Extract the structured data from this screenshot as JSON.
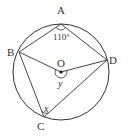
{
  "diagram": {
    "type": "inscribed-quadrilateral-circle",
    "colors": {
      "stroke": "#333333",
      "background": "#ffffff"
    },
    "circle": {
      "center_label": "O",
      "cx": 61,
      "cy": 72,
      "r": 48
    },
    "points": {
      "A": {
        "label": "A",
        "x": 61,
        "y": 24
      },
      "B": {
        "label": "B",
        "x": 19,
        "y": 52
      },
      "C": {
        "label": "C",
        "x": 44,
        "y": 117
      },
      "D": {
        "label": "D",
        "x": 107,
        "y": 60
      },
      "O": {
        "label": "O",
        "x": 61,
        "y": 72
      }
    },
    "angles": {
      "A": {
        "label": "110°"
      },
      "O": {
        "label": "y"
      },
      "C": {
        "label": "x"
      }
    }
  }
}
